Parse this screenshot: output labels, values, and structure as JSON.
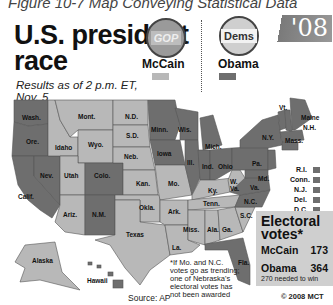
{
  "caption": "Figure 10-7  Map Conveying Statistical Data",
  "header": {
    "title_line1": "U.S. president",
    "title_line2": "race",
    "subtitle_line1": "Results as of 2 p.m. ET,",
    "subtitle_line2": "Nov. 5",
    "year_badge": "'08"
  },
  "legend": {
    "mccain": {
      "badge_text": "GOP",
      "name": "McCain",
      "color": "#b8b8b8"
    },
    "obama": {
      "badge_text": "Dems",
      "name": "Obama",
      "color": "#6e6e6e"
    }
  },
  "states": {
    "wash": "Wash.",
    "ore": "Ore.",
    "calif": "Calif.",
    "idaho": "Idaho",
    "nev": "Nev.",
    "mont": "Mont.",
    "wyo": "Wyo.",
    "utah": "Utah",
    "colo": "Colo.",
    "ariz": "Ariz.",
    "nm": "N.M.",
    "nd": "N.D.",
    "sd": "S.D.",
    "neb": "Neb.",
    "kan": "Kan.",
    "okla": "Okla.",
    "texas": "Texas",
    "minn": "Minn.",
    "iowa": "Iowa",
    "mo": "Mo.",
    "ark": "Ark.",
    "la": "La.",
    "wis": "Wis.",
    "ill": "Ill.",
    "mich": "Mich.",
    "ind": "Ind.",
    "ohio": "Ohio",
    "ky": "Ky.",
    "tenn": "Tenn.",
    "miss": "Miss.",
    "ala": "Ala.",
    "ga": "Ga.",
    "fla": "Fla.",
    "sc": "S.C.",
    "nc": "N.C.",
    "va": "Va.",
    "wva": "W. Va.",
    "pa": "Pa.",
    "ny": "N.Y.",
    "md": "Md.",
    "vt": "Vt.",
    "nh": "N.H.",
    "maine": "Maine",
    "mass": "Mass.",
    "alaska": "Alaska",
    "hawaii": "Hawaii"
  },
  "small_states": [
    {
      "label": "R.I.",
      "winner": "Obama"
    },
    {
      "label": "Conn.",
      "winner": "Obama"
    },
    {
      "label": "N.J.",
      "winner": "Obama"
    },
    {
      "label": "Del.",
      "winner": "Obama"
    },
    {
      "label": "D.C.",
      "winner": "Obama"
    }
  ],
  "electoral": {
    "heading_line1": "Electoral",
    "heading_line2": "votes*",
    "mccain_label": "McCain",
    "mccain_votes": "173",
    "obama_label": "Obama",
    "obama_votes": "364",
    "needed": "270 needed to win"
  },
  "footnote": "*If Mo. and N.C. votes go as trending; one of Nebraska's electoral votes has not been awarded",
  "source": "Source: AP",
  "copyright": "© 2008 MCT"
}
